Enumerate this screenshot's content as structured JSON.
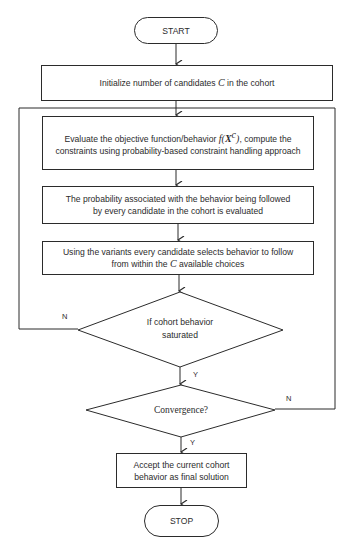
{
  "flowchart": {
    "start": {
      "label": "START"
    },
    "init": {
      "pre": "Initialize number of candidates ",
      "var": "C",
      "post": " in the cohort"
    },
    "evaluate": {
      "pre": "Evaluate the objective function/behavior ",
      "fn": "f",
      "arg": "X",
      "sup": "c",
      "post": ", compute the constraints using probability-based constraint handling approach"
    },
    "probability": {
      "label": "The probability associated with the behavior being followed by every candidate in the cohort is evaluated"
    },
    "variants": {
      "pre": "Using the variants every candidate selects behavior to follow from within the ",
      "var": "C",
      "post": " available choices"
    },
    "decision_saturated": {
      "line1": "If cohort behavior",
      "line2": "saturated",
      "no_label": "N",
      "yes_label": "Y"
    },
    "decision_convergence": {
      "label": "Convergence?",
      "no_label": "N",
      "yes_label": "Y"
    },
    "accept": {
      "line1": "Accept the current cohort",
      "line2": "behavior as final solution"
    },
    "stop": {
      "label": "STOP"
    }
  }
}
